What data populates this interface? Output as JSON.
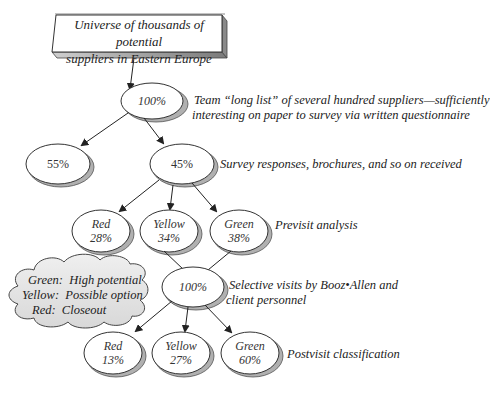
{
  "top_fragment": "pp",
  "source_box": {
    "line1": "Universe of thousands of potential",
    "line2": "suppliers in Eastern Europe"
  },
  "stages": {
    "long_list": {
      "value": "100%",
      "label_line1": "Team “long list” of several hundred suppliers—sufficiently",
      "label_line2": "interesting on paper to survey via written questionnaire"
    },
    "dropped": {
      "value": "55%"
    },
    "responded": {
      "value": "45%",
      "label": "Survey responses, brochures, and so on received"
    },
    "previsit": {
      "label": "Previsit analysis",
      "nodes": [
        {
          "name": "Red",
          "value": "28%"
        },
        {
          "name": "Yellow",
          "value": "34%"
        },
        {
          "name": "Green",
          "value": "38%"
        }
      ]
    },
    "visits": {
      "value": "100%",
      "label_line1": "Selective visits by Booz•Allen and",
      "label_line2": "client personnel"
    },
    "postvisit": {
      "label": "Postvisit classification",
      "nodes": [
        {
          "name": "Red",
          "value": "13%"
        },
        {
          "name": "Yellow",
          "value": "27%"
        },
        {
          "name": "Green",
          "value": "60%"
        }
      ]
    }
  },
  "legend_cloud": {
    "items": [
      {
        "key": "Green:",
        "desc": "High potential"
      },
      {
        "key": "Yellow:",
        "desc": "Possible option"
      },
      {
        "key": "Red:",
        "desc": "Closeout"
      }
    ]
  },
  "colors": {
    "stroke": "#333333",
    "shadow": "#b0b0b0",
    "fill": "#ffffff",
    "cloud_fill": "#e4e4e4"
  }
}
